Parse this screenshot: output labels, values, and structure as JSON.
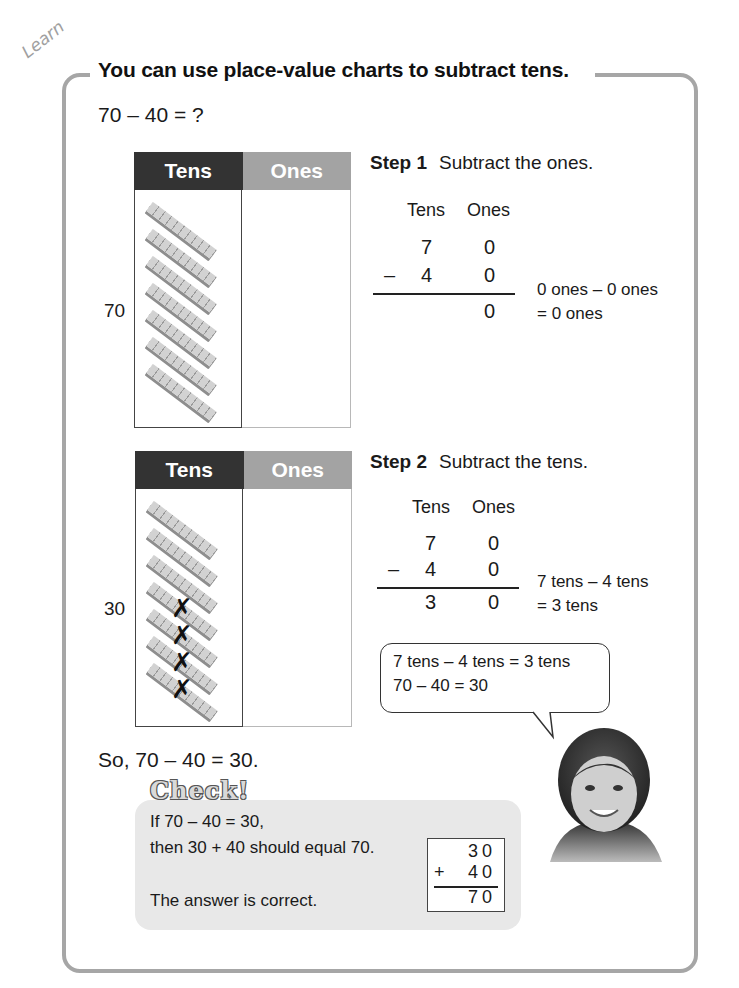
{
  "header": {
    "tag": "Learn",
    "title": "You can use place-value charts to subtract tens."
  },
  "problem": "70 – 40 = ?",
  "charts": [
    {
      "side_label": "70",
      "headers": {
        "tens": "Tens",
        "ones": "Ones"
      },
      "rods": 7,
      "crossed": 0
    },
    {
      "side_label": "30",
      "headers": {
        "tens": "Tens",
        "ones": "Ones"
      },
      "rods": 7,
      "crossed": 4
    }
  ],
  "steps": [
    {
      "label": "Step 1",
      "title": "Subtract the ones.",
      "col_tens": "Tens",
      "col_ones": "Ones",
      "top": {
        "tens": "7",
        "ones": "0"
      },
      "minus": "–",
      "bottom": {
        "tens": "4",
        "ones": "0"
      },
      "result": {
        "tens": "",
        "ones": "0"
      },
      "note_line1": "0 ones – 0 ones",
      "note_line2": "= 0 ones"
    },
    {
      "label": "Step 2",
      "title": "Subtract the tens.",
      "col_tens": "Tens",
      "col_ones": "Ones",
      "top": {
        "tens": "7",
        "ones": "0"
      },
      "minus": "–",
      "bottom": {
        "tens": "4",
        "ones": "0"
      },
      "result": {
        "tens": "3",
        "ones": "0"
      },
      "note_line1": "7 tens – 4 tens",
      "note_line2": "= 3 tens"
    }
  ],
  "speech_bubble": {
    "line1": "7 tens – 4 tens = 3 tens",
    "line2": "70 – 40 = 30"
  },
  "conclusion": "So, 70 – 40 = 30.",
  "check": {
    "title": "Check!",
    "line1": "If 70 – 40 = 30,",
    "line2": "then 30 + 40 should equal 70.",
    "line3": "The answer is correct.",
    "addition": {
      "top": "30",
      "operator": "+",
      "bottom": "40",
      "result": "70"
    }
  },
  "colors": {
    "frame": "#a6a6a6",
    "tens_header": "#333333",
    "ones_header": "#a3a3a3",
    "check_bg": "#e8e8e8"
  }
}
